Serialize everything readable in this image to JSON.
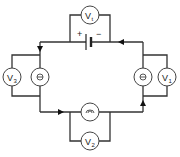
{
  "diagram": {
    "battery": {
      "positive_label": "+",
      "negative_label": "−"
    },
    "voltmeters": [
      {
        "id": "Vt",
        "letter": "V",
        "sub": "t",
        "position": "top"
      },
      {
        "id": "V1",
        "letter": "V",
        "sub": "1",
        "position": "right"
      },
      {
        "id": "V2",
        "letter": "V",
        "sub": "2",
        "position": "bottom"
      },
      {
        "id": "V3",
        "letter": "V",
        "sub": "3",
        "position": "left"
      }
    ],
    "bulbs": [
      {
        "id": "bulb-left",
        "position": "left"
      },
      {
        "id": "bulb-right",
        "position": "right"
      },
      {
        "id": "bulb-bottom",
        "position": "bottom"
      }
    ],
    "current_direction": "clockwise-from-negative: right-top leftwards, left down, bottom rightwards, right up",
    "colors": {
      "wire": "#333333",
      "background": "#ffffff"
    }
  }
}
